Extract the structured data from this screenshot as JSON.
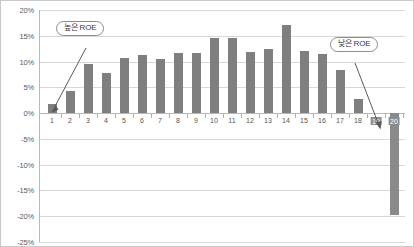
{
  "chart_data": {
    "type": "bar",
    "title": "",
    "subtitle": "",
    "xlabel": "",
    "ylabel": "",
    "grid": true,
    "legend": false,
    "ylim": [
      -25,
      20
    ],
    "ytick_labels": [
      "20%",
      "15%",
      "10%",
      "5%",
      "0%",
      "-5%",
      "-10%",
      "-15%",
      "-20%",
      "-25%"
    ],
    "ytick_values": [
      20,
      15,
      10,
      5,
      0,
      -5,
      -10,
      -15,
      -20,
      -25
    ],
    "categories": [
      "1",
      "2",
      "3",
      "4",
      "5",
      "6",
      "7",
      "8",
      "9",
      "10",
      "11",
      "12",
      "13",
      "14",
      "15",
      "16",
      "17",
      "18",
      "19",
      "20"
    ],
    "values": [
      1.7,
      4.3,
      9.5,
      7.8,
      10.6,
      11.2,
      10.4,
      11.7,
      11.7,
      14.6,
      14.6,
      11.8,
      12.5,
      17.0,
      12.0,
      11.5,
      8.3,
      2.8,
      0.0,
      -19.8
    ],
    "highlighted_categories": [
      "19",
      "20"
    ],
    "bar_color": "#7f7f7f",
    "negative_bar_color": "#8a8a8a",
    "grid_color": "#d8d8d8",
    "axis_color": "#b9b9b9",
    "annotations": [
      {
        "id": "high-roe",
        "text": "높은 ROE",
        "points_to_category": "1"
      },
      {
        "id": "low-roe",
        "text": "낮은 ROE",
        "points_to_category": "20"
      }
    ]
  }
}
